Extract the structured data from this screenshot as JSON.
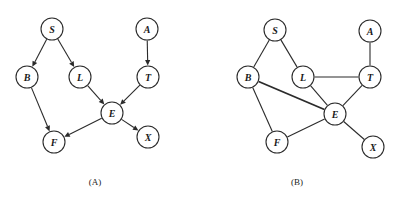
{
  "figure": {
    "background_color": "#ffffff",
    "stroke_color": "#2b2b2b",
    "node_fill": "#ffffff",
    "node_radius": 11
  },
  "panels": [
    {
      "id": "A",
      "caption": "(A)",
      "caption_x": 95,
      "caption_y": 185,
      "type": "directed-acyclic-graph",
      "nodes": [
        {
          "id": "S",
          "label": "S",
          "x": 52,
          "y": 29
        },
        {
          "id": "A",
          "label": "A",
          "x": 147,
          "y": 29
        },
        {
          "id": "B",
          "label": "B",
          "x": 27,
          "y": 77
        },
        {
          "id": "L",
          "label": "L",
          "x": 80,
          "y": 77
        },
        {
          "id": "T",
          "label": "T",
          "x": 148,
          "y": 77
        },
        {
          "id": "E",
          "label": "E",
          "x": 112,
          "y": 113
        },
        {
          "id": "F",
          "label": "F",
          "x": 54,
          "y": 142
        },
        {
          "id": "X",
          "label": "X",
          "x": 148,
          "y": 137
        }
      ],
      "edges": [
        {
          "from": "S",
          "to": "B",
          "directed": true,
          "thick": false
        },
        {
          "from": "S",
          "to": "L",
          "directed": true,
          "thick": false
        },
        {
          "from": "A",
          "to": "T",
          "directed": true,
          "thick": false
        },
        {
          "from": "B",
          "to": "F",
          "directed": true,
          "thick": false
        },
        {
          "from": "L",
          "to": "E",
          "directed": true,
          "thick": false
        },
        {
          "from": "T",
          "to": "E",
          "directed": true,
          "thick": false
        },
        {
          "from": "E",
          "to": "F",
          "directed": true,
          "thick": false
        },
        {
          "from": "E",
          "to": "X",
          "directed": true,
          "thick": false
        }
      ]
    },
    {
      "id": "B",
      "caption": "(B)",
      "caption_x": 97,
      "caption_y": 185,
      "type": "undirected-moral-graph",
      "nodes": [
        {
          "id": "S",
          "label": "S",
          "x": 75,
          "y": 30
        },
        {
          "id": "A",
          "label": "A",
          "x": 170,
          "y": 31
        },
        {
          "id": "B",
          "label": "B",
          "x": 48,
          "y": 77
        },
        {
          "id": "L",
          "label": "L",
          "x": 103,
          "y": 77
        },
        {
          "id": "T",
          "label": "T",
          "x": 170,
          "y": 77
        },
        {
          "id": "E",
          "label": "E",
          "x": 135,
          "y": 114
        },
        {
          "id": "F",
          "label": "F",
          "x": 77,
          "y": 142
        },
        {
          "id": "X",
          "label": "X",
          "x": 173,
          "y": 147
        }
      ],
      "edges": [
        {
          "from": "S",
          "to": "B",
          "directed": false,
          "thick": false
        },
        {
          "from": "S",
          "to": "L",
          "directed": false,
          "thick": false
        },
        {
          "from": "A",
          "to": "T",
          "directed": false,
          "thick": false
        },
        {
          "from": "L",
          "to": "T",
          "directed": false,
          "thick": false
        },
        {
          "from": "L",
          "to": "E",
          "directed": false,
          "thick": false
        },
        {
          "from": "T",
          "to": "E",
          "directed": false,
          "thick": false
        },
        {
          "from": "B",
          "to": "E",
          "directed": false,
          "thick": true
        },
        {
          "from": "B",
          "to": "F",
          "directed": false,
          "thick": false
        },
        {
          "from": "E",
          "to": "F",
          "directed": false,
          "thick": false
        },
        {
          "from": "E",
          "to": "X",
          "directed": false,
          "thick": false
        }
      ]
    }
  ]
}
